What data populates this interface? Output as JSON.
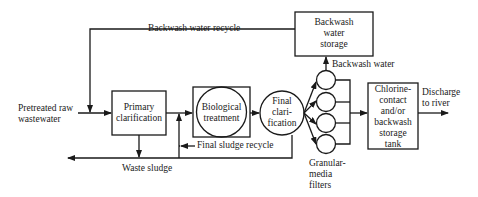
{
  "diagram": {
    "type": "process-flow",
    "nodes": {
      "input": "Pretreated raw wastewater",
      "input_lines": [
        "Pretreated raw",
        "wastewater"
      ],
      "primary": [
        "Primary",
        "clarification"
      ],
      "biological": [
        "Biological",
        "treatment"
      ],
      "final": [
        "Final",
        "clari-",
        "fication"
      ],
      "filters_label": [
        "Granular-",
        "media",
        "filters"
      ],
      "storage": [
        "Backwash",
        "water",
        "storage"
      ],
      "chlorine": [
        "Chlorine-",
        "contact",
        "and/or",
        "backwash",
        "storage",
        "tank"
      ],
      "discharge": [
        "Discharge",
        "to river"
      ]
    },
    "flows": {
      "backwash_recycle": "Backwash water recycle",
      "backwash_water": "Backwash water",
      "final_sludge_recycle": "Final sludge recycle",
      "waste_sludge": "Waste sludge"
    },
    "filter_count": 4
  }
}
